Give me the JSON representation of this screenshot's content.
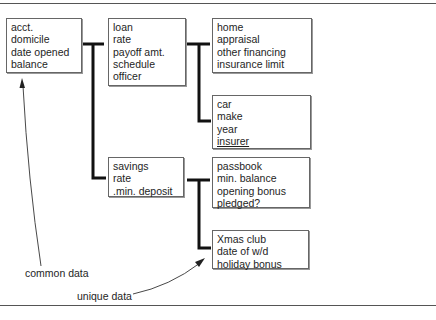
{
  "diagram": {
    "boxes": {
      "account": {
        "lines": [
          "acct.",
          "domicile",
          "date opened",
          "balance"
        ]
      },
      "loan": {
        "lines": [
          "loan",
          "rate",
          "payoff amt.",
          "schedule",
          "officer"
        ]
      },
      "home": {
        "lines": [
          "home",
          "appraisal",
          "other financing",
          "insurance limit"
        ]
      },
      "car": {
        "lines": [
          "car",
          "make",
          "year",
          "insurer"
        ]
      },
      "savings": {
        "lines": [
          "savings",
          "rate",
          ".min. deposit"
        ]
      },
      "passbook": {
        "lines": [
          "passbook",
          "min. balance",
          "opening bonus",
          "pledged?"
        ]
      },
      "xmas": {
        "lines": [
          "Xmas club",
          "date of w/d",
          "holiday bonus"
        ]
      }
    },
    "annotations": {
      "common": "common data",
      "unique": "unique data"
    },
    "colors": {
      "ink": "#1e1e1e",
      "connector": "#111111",
      "border": "#666666"
    }
  }
}
